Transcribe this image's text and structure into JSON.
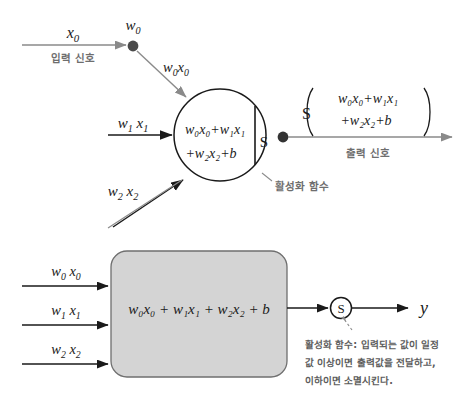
{
  "diagram": {
    "colors": {
      "stroke_dark": "#1a1a1a",
      "stroke_gray": "#8a8a8a",
      "box_fill": "#d4d4d4",
      "box_stroke": "#6f6f6f",
      "text_dark": "#1a1a1a",
      "text_gray": "#6e6e6e",
      "background": "#ffffff"
    },
    "top": {
      "input_signal_label": "입력 신호",
      "input_var": "x",
      "input_var_sub": "0",
      "weight_node_label": "w",
      "weight_node_sub": "0",
      "weighted_edge": {
        "w": "w",
        "w_sub": "0",
        "x": "x",
        "x_sub": "0"
      },
      "input_mid": {
        "w": "w",
        "w_sub": "1",
        "x": "x",
        "x_sub": "1"
      },
      "input_low": {
        "w": "w",
        "w_sub": "2",
        "x": "x",
        "x_sub": "2"
      },
      "body_line1": "w₀x₀+w₁x₁",
      "body_line2": "+w₂x₂+b",
      "activation_symbol": "S",
      "activation_caption": "활성화 함수",
      "output_symbol": "S",
      "output_line1": "w₀x₀+w₁x₁",
      "output_line2": "+w₂x₂+b",
      "output_signal_label": "출력 신호"
    },
    "bottom": {
      "inputs": [
        {
          "w": "w",
          "w_sub": "0",
          "x": "x",
          "x_sub": "0"
        },
        {
          "w": "w",
          "w_sub": "1",
          "x": "x",
          "x_sub": "1"
        },
        {
          "w": "w",
          "w_sub": "2",
          "x": "x",
          "x_sub": "2"
        }
      ],
      "box_formula": "w₀x₀ + w₁x₁ + w₂x₂ + b",
      "activation_symbol": "S",
      "output_var": "y",
      "note_line1": "활성화 함수: 입력되는 값이 일정",
      "note_line2": "값 이상이면 출력값을 전달하고,",
      "note_line3": "이하이면 소멸시킨다."
    }
  }
}
